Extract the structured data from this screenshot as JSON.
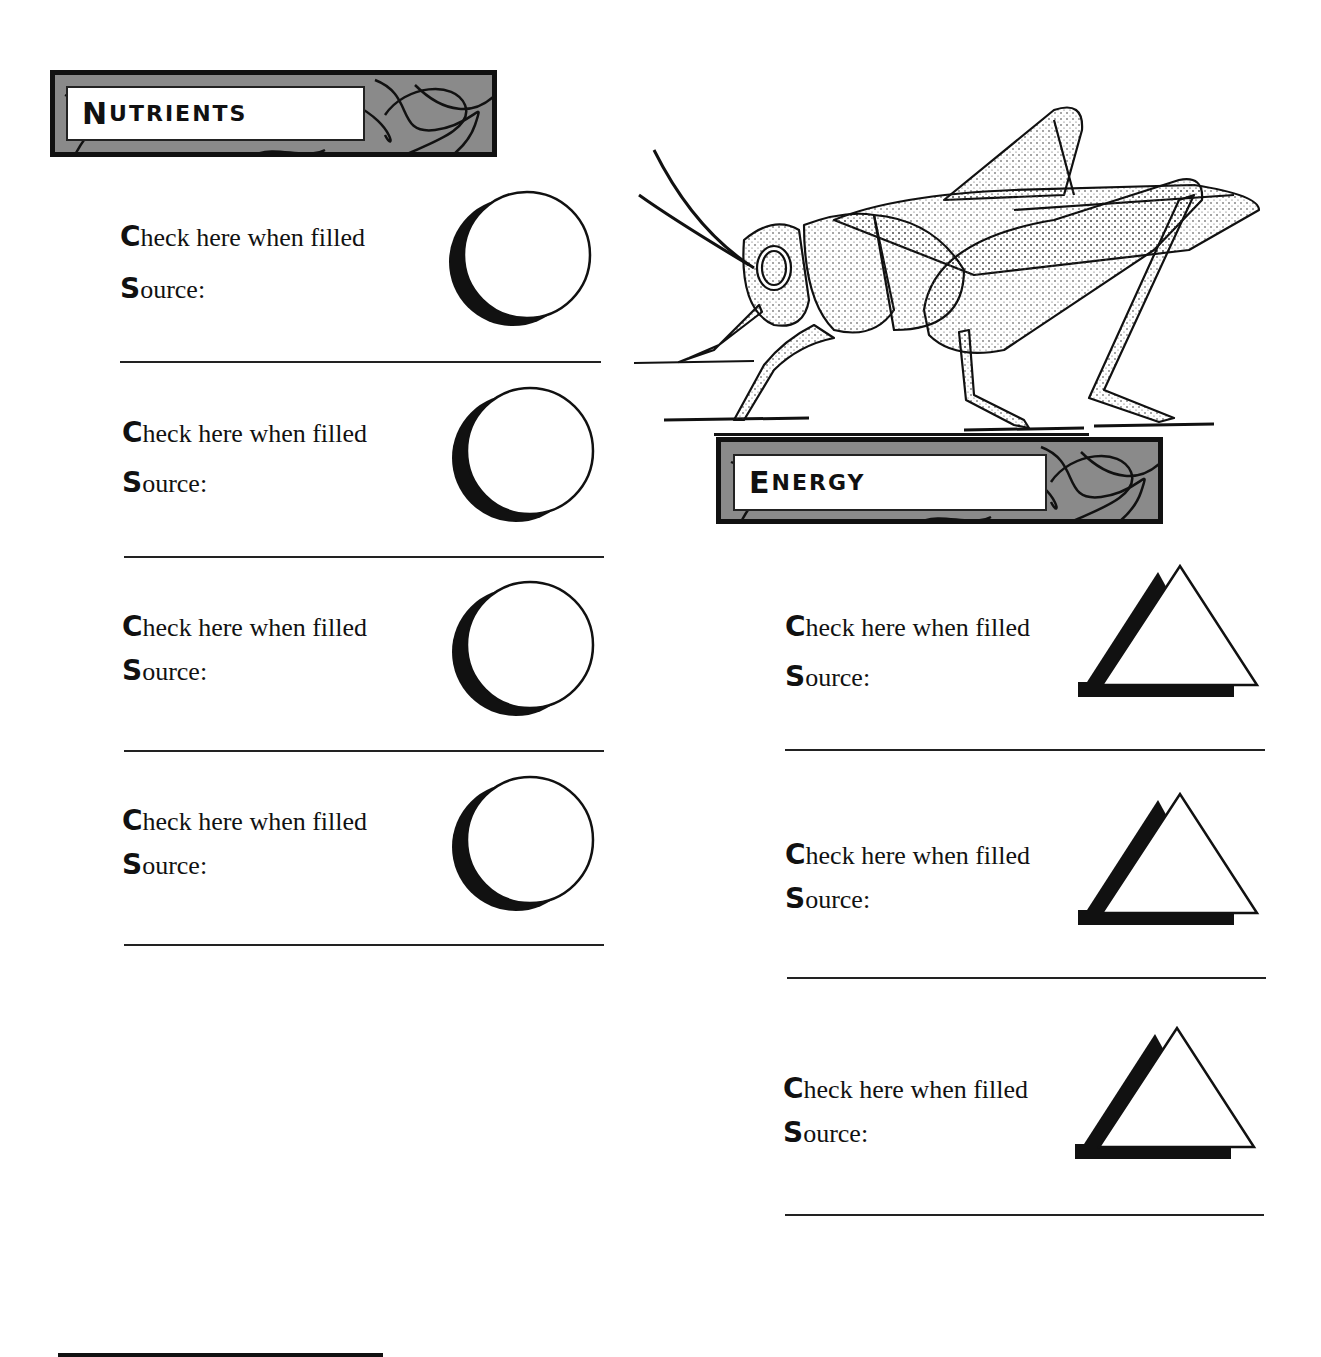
{
  "sections": {
    "nutrients": {
      "title_initial": "N",
      "title_rest": "utrients",
      "shape": "circle-icon",
      "items": [
        {
          "check_initial": "C",
          "check_rest": "heck here when filled",
          "source_initial": "S",
          "source_rest": "ource:"
        },
        {
          "check_initial": "C",
          "check_rest": "heck here when filled",
          "source_initial": "S",
          "source_rest": "ource:"
        },
        {
          "check_initial": "C",
          "check_rest": "heck here when filled",
          "source_initial": "S",
          "source_rest": "ource:"
        },
        {
          "check_initial": "C",
          "check_rest": "heck here when filled",
          "source_initial": "S",
          "source_rest": "ource:"
        }
      ]
    },
    "energy": {
      "title_initial": "E",
      "title_rest": "nergy",
      "shape": "triangle-icon",
      "items": [
        {
          "check_initial": "C",
          "check_rest": "heck here when filled",
          "source_initial": "S",
          "source_rest": "ource:"
        },
        {
          "check_initial": "C",
          "check_rest": "heck here when filled",
          "source_initial": "S",
          "source_rest": "ource:"
        },
        {
          "check_initial": "C",
          "check_rest": "heck here when filled",
          "source_initial": "S",
          "source_rest": "ource:"
        }
      ]
    }
  },
  "illustration": {
    "name": "grasshopper"
  },
  "colors": {
    "header_bg": "#8a8a8a",
    "ink": "#111111",
    "paper": "#ffffff"
  }
}
